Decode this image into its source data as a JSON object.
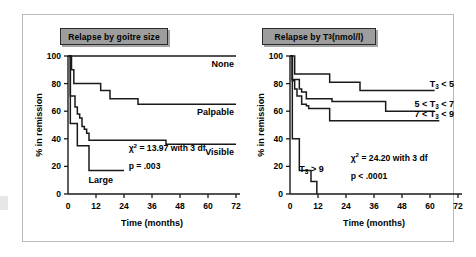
{
  "figure": {
    "background": "#ffffff",
    "frame_color": "#b9b9b9",
    "banner_fill": "#9d9d9d",
    "curve_color": "#1a1a1a"
  },
  "panels": [
    {
      "id": "left",
      "title": "Relapse by goitre size",
      "stat_chi": "χ",
      "stat_chi_sup": "2",
      "stat_rest": " = 13.97 with 3 df",
      "stat_p": "p = .003",
      "chart_data": {
        "type": "line",
        "title": "Relapse by goitre size",
        "xlabel": "Time (months)",
        "ylabel": "% in remission",
        "xlim": [
          0,
          72
        ],
        "ylim": [
          0,
          100
        ],
        "xticks": [
          0,
          12,
          24,
          36,
          48,
          60,
          72
        ],
        "yticks": [
          0,
          20,
          40,
          60,
          80,
          100
        ],
        "grid": false,
        "legend": "inline-right-labels",
        "series": [
          {
            "name": "None",
            "label": "None",
            "steps": [
              [
                0,
                100
              ],
              [
                72,
                100
              ]
            ]
          },
          {
            "name": "Palpable",
            "label": "Palpable",
            "steps": [
              [
                0,
                100
              ],
              [
                1.5,
                90
              ],
              [
                2.5,
                80
              ],
              [
                11,
                80
              ],
              [
                14,
                75
              ],
              [
                17,
                75
              ],
              [
                18,
                69
              ],
              [
                29,
                69
              ],
              [
                30,
                65
              ],
              [
                72,
                65
              ]
            ]
          },
          {
            "name": "Visible",
            "label": "Visible",
            "steps": [
              [
                0,
                100
              ],
              [
                1,
                71
              ],
              [
                2,
                71
              ],
              [
                3,
                63
              ],
              [
                4,
                58
              ],
              [
                5,
                55
              ],
              [
                6,
                49
              ],
              [
                7,
                47
              ],
              [
                8,
                44
              ],
              [
                9,
                39
              ],
              [
                41,
                39
              ],
              [
                42,
                36
              ],
              [
                72,
                36
              ]
            ]
          },
          {
            "name": "Large",
            "label": "Large",
            "steps": [
              [
                0,
                100
              ],
              [
                1,
                51
              ],
              [
                3,
                51
              ],
              [
                4,
                35
              ],
              [
                8,
                35
              ],
              [
                9,
                17
              ],
              [
                24,
                17
              ]
            ]
          }
        ]
      }
    },
    {
      "id": "right",
      "title_pre": "Relapse by T",
      "title_sub": "3",
      "title_post": " (nmol/l)",
      "title": "Relapse by T3 (nmol/l)",
      "stat_chi": "χ",
      "stat_chi_sup": "2",
      "stat_rest": " = 24.20 with 3 df",
      "stat_p": "p < .0001",
      "chart_data": {
        "type": "line",
        "title": "Relapse by T3 (nmol/l)",
        "xlabel": "Time (months)",
        "ylabel": "% in remission",
        "xlim": [
          0,
          72
        ],
        "ylim": [
          0,
          100
        ],
        "xticks": [
          0,
          12,
          24,
          36,
          48,
          60,
          72
        ],
        "yticks": [
          0,
          20,
          40,
          60,
          80,
          100
        ],
        "grid": false,
        "legend": "inline-right-labels",
        "series": [
          {
            "name": "T3 < 5",
            "label_pre": "T",
            "label_sub": "3",
            "label_post": " < 5",
            "label": "T3 < 5",
            "steps": [
              [
                0,
                100
              ],
              [
                2,
                87
              ],
              [
                16,
                87
              ],
              [
                17,
                81
              ],
              [
                29,
                81
              ],
              [
                30,
                75
              ],
              [
                62,
                75
              ]
            ]
          },
          {
            "name": "5 < T3 < 7",
            "label_pre": "5 < T",
            "label_sub": "3",
            "label_post": " < 7",
            "label": "5 < T3 < 7",
            "steps": [
              [
                0,
                100
              ],
              [
                1,
                83
              ],
              [
                3,
                83
              ],
              [
                4,
                76
              ],
              [
                5,
                74
              ],
              [
                7,
                69
              ],
              [
                17,
                69
              ],
              [
                18,
                67
              ],
              [
                40,
                67
              ],
              [
                41,
                60
              ],
              [
                62,
                60
              ]
            ]
          },
          {
            "name": "7 < T3 < 9",
            "label_pre": "7 < T",
            "label_sub": "3",
            "label_post": " < 9",
            "label": "7 < T3 < 9",
            "steps": [
              [
                0,
                100
              ],
              [
                1,
                82
              ],
              [
                2,
                76
              ],
              [
                3,
                71
              ],
              [
                5,
                65
              ],
              [
                7,
                64
              ],
              [
                8,
                62
              ],
              [
                16,
                62
              ],
              [
                17,
                53
              ],
              [
                64,
                53
              ]
            ]
          },
          {
            "name": "T3 > 9",
            "label_pre": "T",
            "label_sub": "3",
            "label_post": " > 9",
            "label": "T3 > 9",
            "steps": [
              [
                0,
                100
              ],
              [
                1,
                40
              ],
              [
                3,
                40
              ],
              [
                4,
                17
              ],
              [
                8,
                17
              ],
              [
                9,
                9
              ],
              [
                11,
                9
              ],
              [
                11.5,
                0
              ]
            ]
          }
        ]
      }
    }
  ],
  "axis": {
    "xlabel": "Time (months)",
    "ylabel": "% in remission",
    "xticks": [
      "0",
      "12",
      "24",
      "36",
      "48",
      "60",
      "72"
    ],
    "yticks": [
      "100",
      "80",
      "60",
      "40",
      "20",
      "0"
    ]
  }
}
